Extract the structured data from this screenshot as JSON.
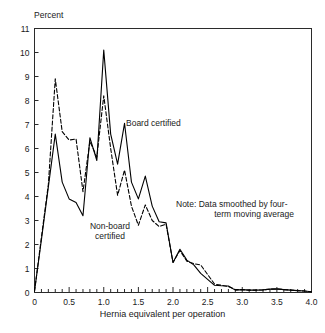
{
  "chart_data": {
    "type": "line",
    "title": "",
    "xlabel": "Hernia equivalent per operation",
    "ylabel": "Percent",
    "xlim": [
      0,
      4.0
    ],
    "ylim": [
      0,
      11
    ],
    "xticks": [
      "0",
      "0.5",
      "1.0",
      "1.5",
      "2.0",
      "2.5",
      "3.0",
      "3.5",
      "4.0"
    ],
    "xtick_values": [
      0,
      0.5,
      1.0,
      1.5,
      2.0,
      2.5,
      3.0,
      3.5,
      4.0
    ],
    "xminor_step": 0.1,
    "yticks": [
      "0",
      "1",
      "2",
      "3",
      "4",
      "5",
      "6",
      "7",
      "8",
      "9",
      "10",
      "11"
    ],
    "ytick_values": [
      0,
      1,
      2,
      3,
      4,
      5,
      6,
      7,
      8,
      9,
      10,
      11
    ],
    "grid": false,
    "legend": "inline-annotations",
    "annotations": [
      {
        "name": "board-certified-label",
        "text": "Board certified",
        "x": 1.33,
        "y": 7.3
      },
      {
        "name": "non-board-certified-label",
        "text": "Non-board\ncertified",
        "x": 0.9,
        "y": 3.0
      },
      {
        "name": "note-label",
        "line1": "Note: Data smoothed by four-",
        "line2": "term moving average",
        "x": 2.05,
        "y": 4.0
      }
    ],
    "x": [
      0,
      0.1,
      0.2,
      0.3,
      0.4,
      0.5,
      0.6,
      0.7,
      0.8,
      0.9,
      1.0,
      1.1,
      1.2,
      1.3,
      1.4,
      1.5,
      1.6,
      1.7,
      1.8,
      1.9,
      2.0,
      2.1,
      2.2,
      2.3,
      2.4,
      2.5,
      2.6,
      2.7,
      2.8,
      2.9,
      3.0,
      3.1,
      3.2,
      3.3,
      3.4,
      3.5,
      3.6,
      3.7,
      3.8,
      3.9,
      4.0
    ],
    "series": [
      {
        "name": "Board certified",
        "style": "solid",
        "color": "#000000",
        "values": [
          0.05,
          2.2,
          4.4,
          6.6,
          4.6,
          3.9,
          3.75,
          3.2,
          6.45,
          5.5,
          10.1,
          6.6,
          5.35,
          7.05,
          4.6,
          3.9,
          4.85,
          3.6,
          2.95,
          2.9,
          1.25,
          1.8,
          1.35,
          1.15,
          0.8,
          0.55,
          0.3,
          0.28,
          0.27,
          0.1,
          0.12,
          0.1,
          0.1,
          0.11,
          0.14,
          0.15,
          0.12,
          0.1,
          0.08,
          0.06,
          0.03
        ]
      },
      {
        "name": "Non-board certified",
        "style": "dashed",
        "color": "#000000",
        "values": [
          0.05,
          2.3,
          4.5,
          8.9,
          6.7,
          6.35,
          6.4,
          4.2,
          6.3,
          5.65,
          8.2,
          6.0,
          4.05,
          5.1,
          3.6,
          2.8,
          3.65,
          3.0,
          2.75,
          2.85,
          1.25,
          1.75,
          1.3,
          1.2,
          1.15,
          0.75,
          0.35,
          0.3,
          0.25,
          0.12,
          0.12,
          0.1,
          0.1,
          0.11,
          0.14,
          0.15,
          0.12,
          0.1,
          0.08,
          0.06,
          0.03
        ]
      }
    ]
  },
  "figure": {
    "ylabel_text": "Percent",
    "xlabel_text": "Hernia equivalent per operation",
    "board_label": "Board certified",
    "nonboard_label_line1": "Non-board",
    "nonboard_label_line2": "certified",
    "note_line1": "Note: Data smoothed by four-",
    "note_line2": "term moving average"
  }
}
